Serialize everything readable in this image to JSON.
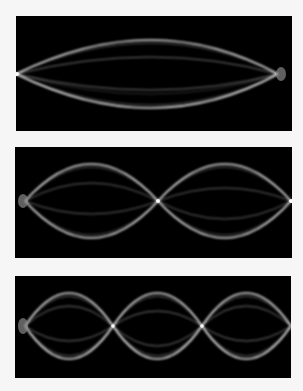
{
  "figure": {
    "background_color": "#f6f6f6",
    "panel_color": "#000000",
    "string_color": "#ffffff",
    "panels": [
      {
        "mode": 1,
        "label": "fundamental",
        "loops": 1,
        "nodes_interior": 0,
        "x": 16,
        "y": 16,
        "w": 276,
        "h": 115
      },
      {
        "mode": 2,
        "label": "second-harmonic",
        "loops": 2,
        "nodes_interior": 1,
        "x": 15,
        "y": 147,
        "w": 277,
        "h": 111
      },
      {
        "mode": 3,
        "label": "third-harmonic",
        "loops": 3,
        "nodes_interior": 2,
        "x": 15,
        "y": 276,
        "w": 276,
        "h": 102
      }
    ]
  }
}
